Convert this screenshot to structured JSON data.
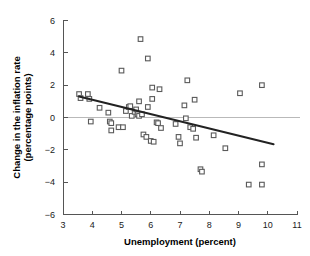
{
  "chart_data": {
    "type": "scatter",
    "title": "",
    "xlabel": "Unemployment (percent)",
    "ylabel": "Change in the inflation rate (percentage points)",
    "ylabel_line1": "Change in the inflation rate",
    "ylabel_line2": "(percentage points)",
    "xlim": [
      3,
      11
    ],
    "ylim": [
      -6,
      6
    ],
    "xticks": [
      3,
      4,
      5,
      6,
      7,
      8,
      9,
      10,
      11
    ],
    "xtick_labels": [
      "3",
      "4",
      "5",
      "6",
      "7",
      "8",
      "9",
      "10",
      "11"
    ],
    "yticks": [
      6,
      4,
      2,
      0,
      -2,
      -4,
      -6
    ],
    "ytick_labels": [
      "6",
      "4",
      "2",
      "0",
      "−2",
      "−4",
      "−6"
    ],
    "grid": false,
    "legend": null,
    "zero_reference_line": {
      "y": 0,
      "color": "#b9b9b9",
      "x_from": 3,
      "x_to": 11.1
    },
    "marker_style": "open-square",
    "marker_color": "#5a5a5a",
    "trend_line": {
      "type": "linear-fit",
      "color": "#222222",
      "x_from": 3.55,
      "y_from": 1.3,
      "x_to": 10.2,
      "y_to": -1.65,
      "slope": -0.443,
      "intercept": 2.873
    },
    "points": [
      {
        "x": 3.55,
        "y": 1.45
      },
      {
        "x": 3.6,
        "y": 1.2
      },
      {
        "x": 3.85,
        "y": 1.45
      },
      {
        "x": 3.9,
        "y": 1.15
      },
      {
        "x": 3.95,
        "y": -0.25
      },
      {
        "x": 4.25,
        "y": 0.6
      },
      {
        "x": 4.55,
        "y": 0.3
      },
      {
        "x": 4.6,
        "y": -0.25
      },
      {
        "x": 4.65,
        "y": -0.35
      },
      {
        "x": 4.65,
        "y": -0.8
      },
      {
        "x": 4.9,
        "y": -0.6
      },
      {
        "x": 5.0,
        "y": 2.9
      },
      {
        "x": 5.05,
        "y": -0.6
      },
      {
        "x": 5.15,
        "y": 0.4
      },
      {
        "x": 5.25,
        "y": 0.65
      },
      {
        "x": 5.3,
        "y": 0.7
      },
      {
        "x": 5.35,
        "y": 0.1
      },
      {
        "x": 5.45,
        "y": 0.35
      },
      {
        "x": 5.5,
        "y": 0.5
      },
      {
        "x": 5.55,
        "y": 0.2
      },
      {
        "x": 5.6,
        "y": 0.1
      },
      {
        "x": 5.6,
        "y": 1.0
      },
      {
        "x": 5.65,
        "y": 4.85
      },
      {
        "x": 5.7,
        "y": 0.2
      },
      {
        "x": 5.75,
        "y": -1.05
      },
      {
        "x": 5.85,
        "y": -1.2
      },
      {
        "x": 5.9,
        "y": 3.65
      },
      {
        "x": 5.9,
        "y": 0.65
      },
      {
        "x": 6.0,
        "y": -1.45
      },
      {
        "x": 6.05,
        "y": 1.85
      },
      {
        "x": 6.05,
        "y": 1.15
      },
      {
        "x": 6.1,
        "y": -1.5
      },
      {
        "x": 6.2,
        "y": -0.3
      },
      {
        "x": 6.25,
        "y": -0.35
      },
      {
        "x": 6.3,
        "y": 1.75
      },
      {
        "x": 6.35,
        "y": -0.65
      },
      {
        "x": 6.85,
        "y": -0.4
      },
      {
        "x": 6.95,
        "y": -1.2
      },
      {
        "x": 7.0,
        "y": -1.6
      },
      {
        "x": 7.15,
        "y": 0.75
      },
      {
        "x": 7.2,
        "y": -0.05
      },
      {
        "x": 7.25,
        "y": 2.3
      },
      {
        "x": 7.35,
        "y": -0.6
      },
      {
        "x": 7.45,
        "y": -0.7
      },
      {
        "x": 7.5,
        "y": 1.1
      },
      {
        "x": 7.55,
        "y": -1.25
      },
      {
        "x": 7.7,
        "y": -3.2
      },
      {
        "x": 7.75,
        "y": -3.35
      },
      {
        "x": 8.15,
        "y": -1.1
      },
      {
        "x": 8.55,
        "y": -1.9
      },
      {
        "x": 9.05,
        "y": 1.5
      },
      {
        "x": 9.35,
        "y": -4.15
      },
      {
        "x": 9.8,
        "y": 2.0
      },
      {
        "x": 9.8,
        "y": -2.9
      },
      {
        "x": 9.8,
        "y": -4.15
      }
    ]
  }
}
